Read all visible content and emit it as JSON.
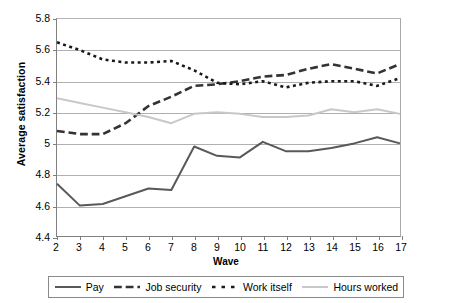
{
  "chart_data": {
    "type": "line",
    "title": "",
    "xlabel": "Wave",
    "ylabel": "Average satisfaction",
    "x": [
      2,
      3,
      4,
      5,
      6,
      7,
      8,
      9,
      10,
      11,
      12,
      13,
      14,
      15,
      16,
      17
    ],
    "xlim": [
      2,
      17
    ],
    "ylim": [
      4.4,
      5.8
    ],
    "yticks": [
      "4.4",
      "4.6",
      "4.8",
      "5",
      "5.2",
      "5.4",
      "5.6",
      "5.8"
    ],
    "ytick_values": [
      4.4,
      4.6,
      4.8,
      5.0,
      5.2,
      5.4,
      5.6,
      5.8
    ],
    "xticks": [
      "2",
      "3",
      "4",
      "5",
      "6",
      "7",
      "8",
      "9",
      "10",
      "11",
      "12",
      "13",
      "14",
      "15",
      "16",
      "17"
    ],
    "grid": true,
    "grid_axis": "y",
    "legend_position": "bottom",
    "series": [
      {
        "name": "Pay",
        "style": "solid",
        "color": "#595959",
        "width": 2.0,
        "values": [
          4.74,
          4.6,
          4.61,
          4.66,
          4.71,
          4.7,
          4.98,
          4.92,
          4.91,
          5.01,
          4.95,
          4.95,
          4.97,
          5.0,
          5.04,
          5.0
        ]
      },
      {
        "name": "Job security",
        "style": "dashed",
        "color": "#333333",
        "width": 2.6,
        "values": [
          5.08,
          5.06,
          5.06,
          5.13,
          5.24,
          5.3,
          5.37,
          5.38,
          5.4,
          5.43,
          5.44,
          5.48,
          5.51,
          5.48,
          5.45,
          5.51
        ]
      },
      {
        "name": "Work itself",
        "style": "dotted",
        "color": "#1a1a1a",
        "width": 2.6,
        "values": [
          5.65,
          5.6,
          5.54,
          5.52,
          5.52,
          5.53,
          5.47,
          5.39,
          5.38,
          5.4,
          5.36,
          5.39,
          5.4,
          5.4,
          5.37,
          5.42
        ]
      },
      {
        "name": "Hours worked",
        "style": "solid",
        "color": "#c8c8c8",
        "width": 2.0,
        "values": [
          5.29,
          5.26,
          5.23,
          5.2,
          5.17,
          5.13,
          5.19,
          5.2,
          5.19,
          5.17,
          5.17,
          5.18,
          5.22,
          5.2,
          5.22,
          5.19
        ]
      }
    ]
  },
  "legend": {
    "items": [
      {
        "label": "Pay"
      },
      {
        "label": "Job security"
      },
      {
        "label": "Work itself"
      },
      {
        "label": "Hours worked"
      }
    ]
  }
}
